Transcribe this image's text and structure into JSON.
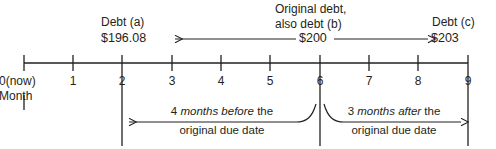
{
  "diagram": {
    "axis": {
      "name": "month-axis",
      "unit_label": "Month",
      "origin_label": "0(now)",
      "ticks": [
        {
          "value": 0,
          "label": "0"
        },
        {
          "value": 1,
          "label": "1"
        },
        {
          "value": 2,
          "label": "2"
        },
        {
          "value": 3,
          "label": "3"
        },
        {
          "value": 4,
          "label": "4"
        },
        {
          "value": 5,
          "label": "5"
        },
        {
          "value": 6,
          "label": "6"
        },
        {
          "value": 7,
          "label": "7"
        },
        {
          "value": 8,
          "label": "8"
        },
        {
          "value": 9,
          "label": "9"
        }
      ]
    },
    "markers": {
      "debt_a": {
        "caption": "Debt (a)",
        "amount": "$196.08",
        "month": 2
      },
      "debt_b": {
        "caption_line1": "Original debt,",
        "caption_line2": "also debt (b)",
        "amount": "$200",
        "month": 6
      },
      "debt_c": {
        "caption": "Debt (c)",
        "amount": "$203",
        "month": 9
      }
    },
    "spans": {
      "before": {
        "line1_pre": "4 ",
        "line1_italic": "months before",
        "line1_post": " the",
        "line2": "original due date",
        "from_month": 6,
        "to_month": 2
      },
      "after": {
        "line1_pre": "3 ",
        "line1_italic": "months after",
        "line1_post": " the",
        "line2": "original due date",
        "from_month": 6,
        "to_month": 9
      }
    },
    "colors": {
      "ink": "#231f20",
      "background": "#ffffff"
    }
  }
}
